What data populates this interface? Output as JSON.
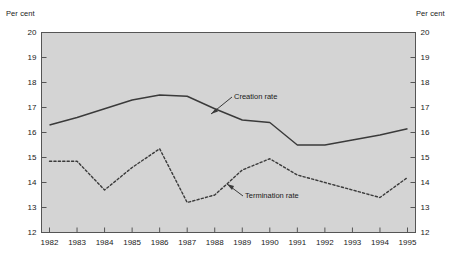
{
  "axes": {
    "unit_left": "Per cent",
    "unit_right": "Per cent",
    "y_ticks": [
      "20",
      "19",
      "18",
      "17",
      "16",
      "15",
      "14",
      "13",
      "12"
    ],
    "x_ticks": [
      "1982",
      "1983",
      "1984",
      "1985",
      "1986",
      "1987",
      "1988",
      "1989",
      "1990",
      "1991",
      "1992",
      "1993",
      "1994",
      "1995"
    ]
  },
  "annotations": {
    "creation": "Creation rate",
    "termination": "Termination rate"
  },
  "colors": {
    "plot_background": "#d4d4d4",
    "frame": "#555555",
    "series_creation": "#3a3a3a",
    "series_termination": "#3a3a3a",
    "text": "#1a1a1a"
  },
  "chart_data": {
    "type": "line",
    "title": "",
    "subtitle": "",
    "xlabel": "",
    "ylabel": "Per cent",
    "ylim": [
      12,
      20
    ],
    "yticks": [
      12,
      13,
      14,
      15,
      16,
      17,
      18,
      19,
      20
    ],
    "grid": false,
    "legend": "inline-annotations",
    "categories": [
      1982,
      1983,
      1984,
      1985,
      1986,
      1987,
      1988,
      1989,
      1990,
      1991,
      1992,
      1993,
      1994,
      1995
    ],
    "x": [
      1982,
      1983,
      1984,
      1985,
      1986,
      1987,
      1988,
      1989,
      1990,
      1991,
      1992,
      1993,
      1994,
      1995
    ],
    "series": [
      {
        "name": "Creation rate",
        "style": "solid",
        "values": [
          16.3,
          16.6,
          16.95,
          17.3,
          17.5,
          17.45,
          16.95,
          16.5,
          16.4,
          15.5,
          15.5,
          15.7,
          15.9,
          16.15
        ]
      },
      {
        "name": "Termination rate",
        "style": "dotted",
        "values": [
          14.85,
          14.85,
          13.7,
          14.6,
          15.35,
          13.2,
          13.5,
          14.5,
          14.95,
          14.3,
          14.0,
          13.7,
          13.4,
          14.2
        ]
      }
    ]
  }
}
